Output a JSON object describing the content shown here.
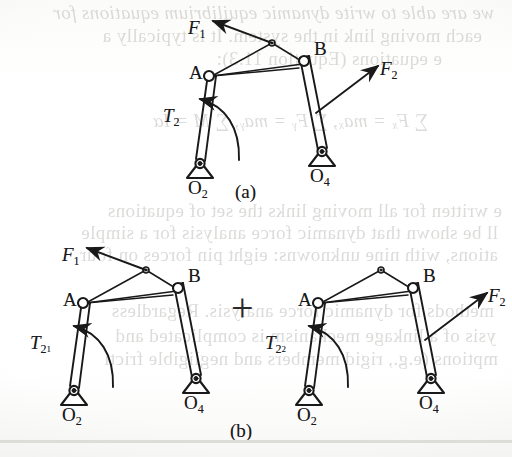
{
  "document": {
    "type": "scanned-textbook-figure",
    "page_background": "#fdfdfc",
    "ink_color": "#19191a",
    "showthrough_color": "#8c8a85"
  },
  "figure": {
    "caption_a": "(a)",
    "caption_b": "(b)",
    "operator": "+",
    "parts": [
      {
        "id": "a",
        "caption": "(a)",
        "description": "complete linkage with both applied forces F1 and F2 and the total input torque T2",
        "labels": [
          {
            "name": "force-f1",
            "base": "F",
            "subscript": "1"
          },
          {
            "name": "force-f2",
            "base": "F",
            "subscript": "2"
          },
          {
            "name": "torque-t2",
            "base": "T",
            "subscript": "2"
          },
          {
            "name": "joint-a",
            "base": "A",
            "subscript": ""
          },
          {
            "name": "joint-b",
            "base": "B",
            "subscript": ""
          },
          {
            "name": "ground-pivot-o2",
            "base": "O",
            "subscript": "2"
          },
          {
            "name": "ground-pivot-o4",
            "base": "O",
            "subscript": "4"
          }
        ]
      },
      {
        "id": "b-left",
        "caption": "",
        "description": "linkage with only force F1 applied and the partial input torque T2 sub 1",
        "labels": [
          {
            "name": "force-f1",
            "base": "F",
            "subscript": "1"
          },
          {
            "name": "torque-t21",
            "base": "T",
            "subscript": "2",
            "subsubscript": "1"
          },
          {
            "name": "joint-a",
            "base": "A",
            "subscript": ""
          },
          {
            "name": "joint-b",
            "base": "B",
            "subscript": ""
          },
          {
            "name": "ground-pivot-o2",
            "base": "O",
            "subscript": "2"
          },
          {
            "name": "ground-pivot-o4",
            "base": "O",
            "subscript": "4"
          }
        ]
      },
      {
        "id": "b-right",
        "caption": "",
        "description": "linkage with only force F2 applied and the partial input torque T2 sub 2",
        "labels": [
          {
            "name": "force-f2",
            "base": "F",
            "subscript": "2"
          },
          {
            "name": "torque-t22",
            "base": "T",
            "subscript": "2",
            "subsubscript": "2"
          },
          {
            "name": "joint-a",
            "base": "A",
            "subscript": ""
          },
          {
            "name": "joint-b",
            "base": "B",
            "subscript": ""
          },
          {
            "name": "ground-pivot-o2",
            "base": "O",
            "subscript": "2"
          },
          {
            "name": "ground-pivot-o4",
            "base": "O",
            "subscript": "4"
          }
        ]
      }
    ]
  },
  "labels": {
    "f_base": "F",
    "t_base": "T",
    "a": "A",
    "b": "B",
    "o": "O",
    "one": "1",
    "two": "2",
    "four": "4"
  },
  "showthrough_text": [
    {
      "text": "we are able to write dynamic equilibrium equations for",
      "x": 18,
      "y": 2
    },
    {
      "text": "each moving link in the system. It is typically a",
      "x": 30,
      "y": 25
    },
    {
      "text": "e equations (Equation 11.3):",
      "x": 70,
      "y": 48
    },
    {
      "text": "∑ Fₓ = maₓ,   ∑ Fᵧ = maᵧ,   ∑ M = Iα",
      "x": 84,
      "y": 110
    },
    {
      "text": "e written for all moving links the set of equations",
      "x": 10,
      "y": 200
    },
    {
      "text": "ll be shown that dynamic force analysis for a simple",
      "x": 14,
      "y": 222
    },
    {
      "text": "ations, with nine unknowns: eight pin forces on four",
      "x": 14,
      "y": 244
    },
    {
      "text": "methods for dynamic force analysis. Regardless",
      "x": 18,
      "y": 300
    },
    {
      "text": "ysis of a linkage mechanism is complicated and",
      "x": 16,
      "y": 325
    },
    {
      "text": "mptions (e.g., rigid members and negligible fricti",
      "x": 14,
      "y": 348
    }
  ]
}
